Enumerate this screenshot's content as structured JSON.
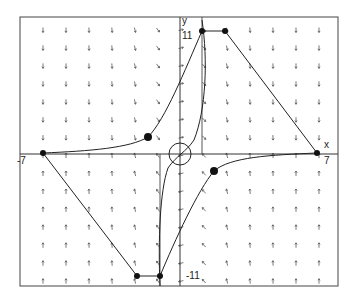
{
  "diagram": {
    "type": "phase-portrait / direction field",
    "axis_labels": {
      "x": "x",
      "y": "y"
    },
    "tick_labels": {
      "x_max": "7",
      "x_min": "-7",
      "y_max": "11",
      "y_min": "-11"
    },
    "colors": {
      "ink": "#222222",
      "arrows": "#555555",
      "frame": "#444444",
      "background": "#ffffff"
    },
    "frame": {
      "left": 20,
      "top": 17,
      "right": 338,
      "bottom": 286
    },
    "origin_px": {
      "x": 180,
      "y": 154
    },
    "points": [
      {
        "id": "p1",
        "x": 202,
        "y": 31
      },
      {
        "id": "p2",
        "x": 225,
        "y": 31
      },
      {
        "id": "p3",
        "x": 148,
        "y": 137
      },
      {
        "id": "p4",
        "x": 43,
        "y": 153
      },
      {
        "id": "p5",
        "x": 317,
        "y": 153
      },
      {
        "id": "p6",
        "x": 214,
        "y": 171
      },
      {
        "id": "p7",
        "x": 137,
        "y": 276
      },
      {
        "id": "p8",
        "x": 160,
        "y": 276
      }
    ],
    "origin_circle": {
      "cx": 180,
      "cy": 154,
      "r": 11
    }
  }
}
